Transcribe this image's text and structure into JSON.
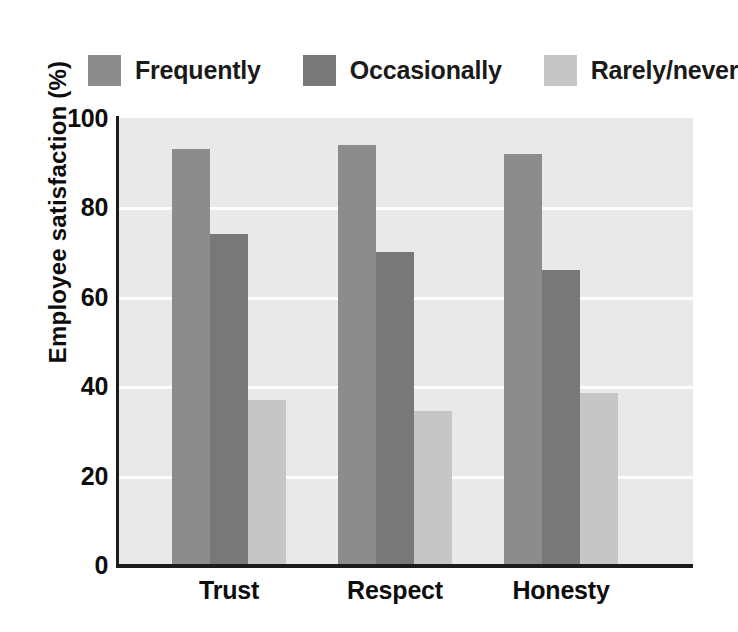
{
  "chart_data": {
    "type": "bar",
    "title": "",
    "subtitle": "",
    "xlabel": "",
    "ylabel": "Employee satisfaction (%)",
    "categories": [
      "Trust",
      "Respect",
      "Honesty"
    ],
    "series": [
      {
        "name": "Frequently",
        "color": "#8c8c8c",
        "values": [
          93,
          94,
          92
        ]
      },
      {
        "name": "Occasionally",
        "color": "#787878",
        "values": [
          74,
          70,
          66
        ]
      },
      {
        "name": "Rarely/never",
        "color": "#c6c6c6",
        "values": [
          37,
          34.5,
          38.5
        ]
      }
    ],
    "ylim": [
      0,
      100
    ],
    "yticks": [
      0,
      20,
      40,
      60,
      80,
      100
    ],
    "ytick_labels": [
      "0",
      "20",
      "40",
      "60",
      "80",
      "100"
    ],
    "grid": true,
    "gridlines_at": [
      20,
      40,
      60,
      80
    ],
    "grid_color": "#fdfdfd",
    "legend_position": "top",
    "plot_background": "#e9e9e9",
    "page_background": "#ffffff",
    "axis_color": "#1c1c1c",
    "text_color": "#0d0d0d"
  },
  "legend": {
    "items": [
      {
        "label": "Frequently",
        "color": "#8c8c8c"
      },
      {
        "label": "Occasionally",
        "color": "#787878"
      },
      {
        "label": "Rarely/never",
        "color": "#c6c6c6"
      }
    ]
  },
  "axes": {
    "y_title": "Employee satisfaction (%)",
    "y_tick_labels": [
      "100",
      "80",
      "60",
      "40",
      "20",
      "0"
    ],
    "x_tick_labels": [
      "Trust",
      "Respect",
      "Honesty"
    ]
  }
}
